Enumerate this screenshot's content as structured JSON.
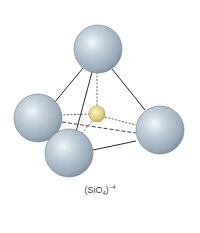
{
  "diagram": {
    "label": {
      "prefix": "(SiO",
      "subscript": "4",
      "suffix": ")",
      "superscript": "−4"
    },
    "atoms": [
      {
        "id": "oxygen-top",
        "element": "O"
      },
      {
        "id": "oxygen-left",
        "element": "O"
      },
      {
        "id": "oxygen-front",
        "element": "O"
      },
      {
        "id": "oxygen-right",
        "element": "O"
      },
      {
        "id": "silicon-center",
        "element": "Si"
      }
    ],
    "colors": {
      "oxygen": "#a9b9c6",
      "oxygen_highlight": "#eef3f7",
      "oxygen_shadow": "#7a8c9a",
      "silicon": "#e3d27a",
      "silicon_highlight": "#f7efbf",
      "bond": "#333333"
    }
  }
}
